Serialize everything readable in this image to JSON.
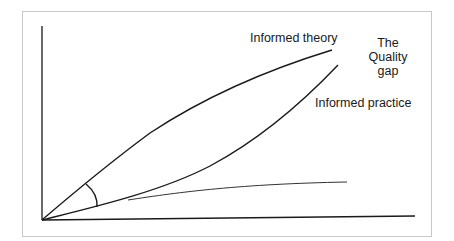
{
  "diagram": {
    "labels": {
      "informed_theory": "Informed theory",
      "quality_gap_line1": "The",
      "quality_gap_line2": "Quality",
      "quality_gap_line3": "gap",
      "informed_practice": "Informed practice"
    },
    "curves": [
      {
        "name": "Informed theory",
        "points": [
          [
            42,
            220
          ],
          [
            86,
            184
          ],
          [
            150,
            133
          ],
          [
            250,
            85
          ],
          [
            332,
            50
          ]
        ]
      },
      {
        "name": "Informed practice",
        "points": [
          [
            42,
            220
          ],
          [
            97,
            207
          ],
          [
            128,
            200
          ],
          [
            200,
            172
          ],
          [
            260,
            130
          ],
          [
            305,
            88
          ],
          [
            338,
            65
          ]
        ]
      },
      {
        "name": "Actual practice (unlabelled)",
        "points": [
          [
            128,
            200
          ],
          [
            200,
            190
          ],
          [
            280,
            183
          ],
          [
            347,
            182
          ]
        ]
      }
    ],
    "angle_marker": {
      "from": [
        86,
        184
      ],
      "to": [
        97,
        207
      ]
    },
    "colors": {
      "line": "#1a1a1a",
      "frame": "#c8c8c8",
      "background": "#ffffff"
    }
  }
}
